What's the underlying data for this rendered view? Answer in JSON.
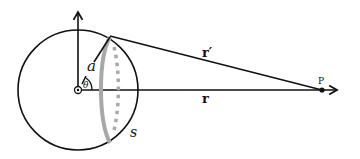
{
  "diagram": {
    "type": "geometry",
    "colors": {
      "stroke": "#111111",
      "ring": "#a8a8a8",
      "ring_dashed": "#a8a8a8",
      "background": "#ffffff"
    },
    "labels": {
      "radius": "a",
      "angle": "θ",
      "r_prime": "r′",
      "r": "r",
      "ring": "s",
      "point": "P"
    },
    "geometry": {
      "center": [
        78,
        90
      ],
      "sphere_radius": 60,
      "ring_top": [
        110,
        37
      ],
      "ring_bottom": [
        110,
        143
      ],
      "point_P": [
        322,
        90
      ]
    }
  }
}
